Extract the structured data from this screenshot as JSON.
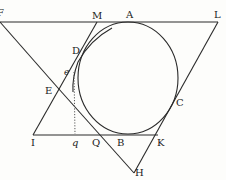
{
  "diagram": {
    "type": "geometric-construction",
    "colors": {
      "ink": "#2a2a2a",
      "background": "#fdfdfb"
    },
    "labels": {
      "F": "F",
      "M": "M",
      "A": "A",
      "L": "L",
      "D": "D",
      "e": "e",
      "E": "E",
      "C": "C",
      "I": "I",
      "q": "q",
      "Q": "Q",
      "B": "B",
      "K": "K",
      "H": "H"
    }
  }
}
